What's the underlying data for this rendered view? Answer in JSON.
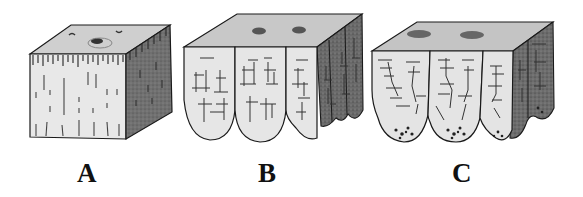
{
  "figure": {
    "panels": [
      {
        "id": "A",
        "label": "A",
        "description": "Solid cube block with vertical streak marks and a small depression on top"
      },
      {
        "id": "B",
        "label": "B",
        "description": "Block whose front face splits into rounded lobes with cracked pattern"
      },
      {
        "id": "C",
        "label": "C",
        "description": "Block with eroded rounded lobes, horizontal crack lines and speckled tips"
      }
    ],
    "colors": {
      "background": "#ffffff",
      "outline": "#1a1a1a",
      "top_face": "#cfcfcf",
      "front_face": "#e6e6e6",
      "side_face": "#6e6e6e"
    }
  }
}
